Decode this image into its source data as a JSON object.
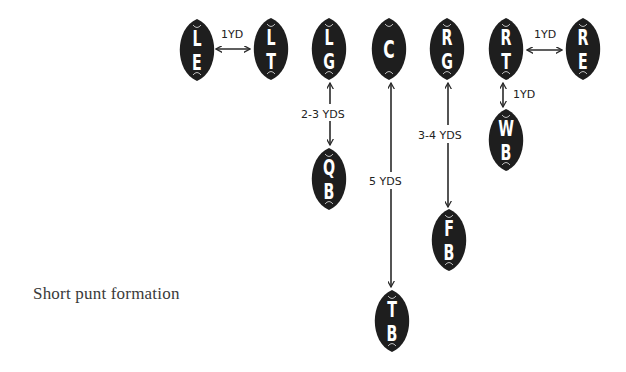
{
  "caption": "Short punt formation",
  "colors": {
    "ball": "#1e1e1e",
    "letter": "#ffffff",
    "line": "#2a2a2a",
    "text": "#3a3a3a"
  },
  "players": [
    {
      "id": "LE",
      "label": "LE",
      "letters": [
        "L",
        "E"
      ],
      "cx": 197,
      "cy": 50
    },
    {
      "id": "LT",
      "label": "LT",
      "letters": [
        "L",
        "T"
      ],
      "cx": 271,
      "cy": 49
    },
    {
      "id": "LG",
      "label": "LG",
      "letters": [
        "L",
        "G"
      ],
      "cx": 329,
      "cy": 49
    },
    {
      "id": "C",
      "label": "C",
      "letters": [
        "C"
      ],
      "cx": 389,
      "cy": 49
    },
    {
      "id": "RG",
      "label": "RG",
      "letters": [
        "R",
        "G"
      ],
      "cx": 447,
      "cy": 49
    },
    {
      "id": "RT",
      "label": "RT",
      "letters": [
        "R",
        "T"
      ],
      "cx": 506,
      "cy": 49
    },
    {
      "id": "RE",
      "label": "RE",
      "letters": [
        "R",
        "E"
      ],
      "cx": 583,
      "cy": 49
    },
    {
      "id": "WB",
      "label": "WB",
      "letters": [
        "W",
        "B"
      ],
      "cx": 506,
      "cy": 140
    },
    {
      "id": "QB",
      "label": "QB",
      "letters": [
        "Q",
        "B"
      ],
      "cx": 329,
      "cy": 179
    },
    {
      "id": "FB",
      "label": "FB",
      "letters": [
        "F",
        "B"
      ],
      "cx": 449,
      "cy": 240
    },
    {
      "id": "TB",
      "label": "TB",
      "letters": [
        "T",
        "B"
      ],
      "cx": 392,
      "cy": 321
    }
  ],
  "spacings": [
    {
      "id": "LE-LT",
      "label": "1YD",
      "orientation": "horizontal",
      "from": "LE",
      "to": "LT"
    },
    {
      "id": "RT-RE",
      "label": "1YD",
      "orientation": "horizontal",
      "from": "RT",
      "to": "RE"
    },
    {
      "id": "RT-WB",
      "label": "1YD",
      "orientation": "vertical",
      "from": "RT",
      "to": "WB"
    },
    {
      "id": "LG-QB",
      "label": "2-3 YDS",
      "orientation": "vertical",
      "from": "LG",
      "to": "QB"
    },
    {
      "id": "C-TB",
      "label": "5 YDS",
      "orientation": "vertical",
      "from": "C",
      "to": "TB"
    },
    {
      "id": "RG-FB",
      "label": "3-4 YDS",
      "orientation": "vertical",
      "from": "RG",
      "to": "FB"
    }
  ]
}
